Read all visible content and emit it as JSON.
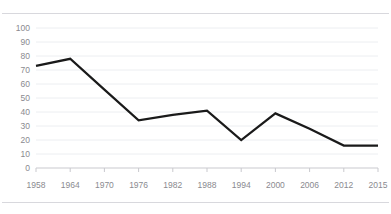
{
  "chart_data": {
    "type": "line",
    "title": "",
    "subtitle": "",
    "xlabel": "",
    "ylabel": "",
    "categories": [
      "1958",
      "1964",
      "1970",
      "1976",
      "1982",
      "1988",
      "1994",
      "2000",
      "2006",
      "2012",
      "2015"
    ],
    "series": [
      {
        "name": "",
        "values": [
          73,
          78,
          56,
          34,
          38,
          41,
          20,
          39,
          28,
          16,
          16
        ],
        "color": "#1a1a1a"
      }
    ],
    "ylim": [
      0,
      100
    ],
    "ytick_labels": [
      "100",
      "90",
      "80",
      "70",
      "60",
      "50",
      "40",
      "30",
      "20",
      "10",
      "0"
    ],
    "ytick_values": [
      100,
      90,
      80,
      70,
      60,
      50,
      40,
      30,
      20,
      10,
      0
    ],
    "grid": true,
    "grid_axis": "y",
    "grid_color": "#eceef1",
    "legend": false,
    "legend_position": "none",
    "markers": false,
    "line_width": 2.2,
    "background_color": "#ffffff",
    "tick_label_color": "#8a8a8f",
    "frame_rule_color": "#d8d8dd",
    "vertex_years": [
      "1958",
      "1964",
      "1976",
      "1982",
      "1988",
      "1994",
      "2000",
      "2012",
      "2015"
    ],
    "interpolated_years": [
      "1970",
      "2006"
    ]
  }
}
